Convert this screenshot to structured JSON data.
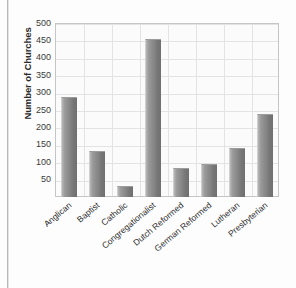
{
  "chart_data": {
    "type": "bar",
    "title": "",
    "xlabel": "",
    "ylabel": "Number of Churches",
    "ylim": [
      0,
      500
    ],
    "ytick_values": [
      500,
      450,
      400,
      350,
      300,
      250,
      200,
      150,
      100,
      50
    ],
    "ytick_labels": [
      "500",
      "450",
      "400",
      "350",
      "300",
      "250",
      "200",
      "150",
      "100",
      "50"
    ],
    "grid": true,
    "legend": "none",
    "categories": [
      "Anglican",
      "Baptist",
      "Catholic",
      "Congregationalist",
      "Dutch Reformed",
      "German Reformed",
      "Lutheran",
      "Presbyterian"
    ],
    "values": [
      288,
      133,
      32,
      455,
      83,
      95,
      142,
      238
    ],
    "bar_color": "#8a8a8a",
    "plot_background": "#fbfbfb",
    "gridline_color": "#e3e3e3",
    "axis_color": "#c5c5c5"
  }
}
